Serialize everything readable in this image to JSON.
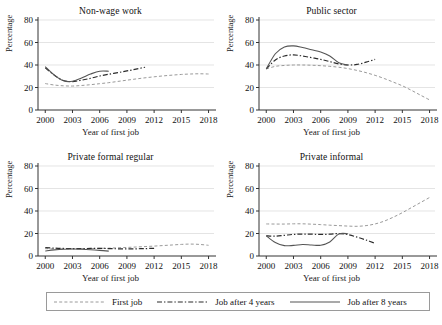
{
  "figure": {
    "panel_count": 4,
    "shared_xlabel": "Year of first job",
    "shared_ylabel": "Percentage"
  },
  "legend": {
    "items": [
      {
        "label": "First job",
        "style": "dotted-dash",
        "color": "#8c8c8c",
        "key": "first_job"
      },
      {
        "label": "Job after 4 years",
        "style": "dash-dot",
        "color": "#2b2b2b",
        "key": "after_4"
      },
      {
        "label": "Job after 8 years",
        "style": "solid",
        "color": "#4a4a4a",
        "key": "after_8"
      }
    ]
  },
  "panels": [
    {
      "title": "Non-wage work",
      "index": 0
    },
    {
      "title": "Public sector",
      "index": 1
    },
    {
      "title": "Private formal regular",
      "index": 2
    },
    {
      "title": "Private informal",
      "index": 3
    }
  ],
  "axes": {
    "xticks": [
      2000,
      2003,
      2006,
      2009,
      2012,
      2015,
      2018
    ],
    "yticks": [
      0,
      20,
      40,
      60,
      80
    ],
    "xlim": [
      1999.2,
      2018.6
    ],
    "ylim": [
      0,
      80
    ],
    "gridlines": [
      20,
      40,
      60,
      80
    ],
    "grid": true
  },
  "chart_data": {
    "type": "line",
    "title": "",
    "xlabel": "Year of first job",
    "ylabel": "Percentage",
    "xlim": [
      1999.2,
      2018.6
    ],
    "ylim": [
      0,
      80
    ],
    "grid": true,
    "legend_position": "bottom",
    "panel_layout": "2x2",
    "panels": [
      {
        "title": "Non-wage work",
        "series": [
          {
            "name": "First job",
            "style": "dotted-dash",
            "x": [
              2000,
              2001,
              2002,
              2003,
              2004,
              2005,
              2006,
              2007,
              2008,
              2009,
              2010,
              2011,
              2012,
              2013,
              2014,
              2015,
              2016,
              2017,
              2018
            ],
            "values": [
              23.5,
              22.2,
              21.5,
              21.3,
              21.8,
              22.5,
              23.4,
              24.3,
              25.4,
              26.5,
              27.6,
              28.6,
              29.5,
              30.3,
              31.0,
              31.6,
              32.0,
              32.2,
              32.0
            ]
          },
          {
            "name": "Job after 4 years",
            "style": "dash-dot",
            "x": [
              2000,
              2001,
              2002,
              2003,
              2004,
              2005,
              2006,
              2007,
              2008,
              2009,
              2010,
              2011
            ],
            "values": [
              37.5,
              31.0,
              26.2,
              25.3,
              26.5,
              28.2,
              30.2,
              31.8,
              33.2,
              34.7,
              36.3,
              38.0
            ]
          },
          {
            "name": "Job after 8 years",
            "style": "solid",
            "x": [
              2000,
              2001,
              2002,
              2003,
              2004,
              2005,
              2006,
              2007
            ],
            "values": [
              38.5,
              31.0,
              26.0,
              25.5,
              28.5,
              32.0,
              34.5,
              34.5
            ]
          }
        ]
      },
      {
        "title": "Public sector",
        "series": [
          {
            "name": "First job",
            "style": "dotted-dash",
            "x": [
              2000,
              2001,
              2002,
              2003,
              2004,
              2005,
              2006,
              2007,
              2008,
              2009,
              2010,
              2011,
              2012,
              2013,
              2014,
              2015,
              2016,
              2017,
              2018
            ],
            "values": [
              36.5,
              38.8,
              39.6,
              40.0,
              40.0,
              39.8,
              39.4,
              38.8,
              38.0,
              36.8,
              35.2,
              33.2,
              30.8,
              28.0,
              24.8,
              21.5,
              17.5,
              13.2,
              9.0
            ]
          },
          {
            "name": "Job after 4 years",
            "style": "dash-dot",
            "x": [
              2000,
              2001,
              2002,
              2003,
              2004,
              2005,
              2006,
              2007,
              2008,
              2009,
              2010,
              2011,
              2012
            ],
            "values": [
              36.5,
              44.5,
              48.0,
              49.0,
              48.0,
              46.5,
              45.0,
              43.0,
              41.0,
              40.0,
              40.5,
              42.5,
              45.0
            ]
          },
          {
            "name": "Job after 8 years",
            "style": "solid",
            "x": [
              2000,
              2001,
              2002,
              2003,
              2004,
              2005,
              2006,
              2007,
              2008,
              2009
            ],
            "values": [
              36.5,
              50.0,
              56.0,
              57.0,
              55.5,
              53.5,
              51.5,
              48.0,
              42.0,
              40.0
            ]
          }
        ]
      },
      {
        "title": "Private formal regular",
        "series": [
          {
            "name": "First job",
            "style": "dotted-dash",
            "x": [
              2000,
              2001,
              2002,
              2003,
              2004,
              2005,
              2006,
              2007,
              2008,
              2009,
              2010,
              2011,
              2012,
              2013,
              2014,
              2015,
              2016,
              2017,
              2018
            ],
            "values": [
              6.5,
              6.4,
              6.3,
              6.4,
              6.5,
              6.6,
              6.8,
              7.0,
              7.3,
              7.6,
              8.0,
              8.4,
              8.8,
              9.3,
              9.8,
              10.3,
              10.6,
              10.3,
              9.5
            ]
          },
          {
            "name": "Job after 4 years",
            "style": "dash-dot",
            "x": [
              2000,
              2001,
              2002,
              2003,
              2004,
              2005,
              2006,
              2007,
              2008,
              2009,
              2010,
              2011,
              2012
            ],
            "values": [
              7.5,
              7.0,
              6.7,
              6.6,
              6.6,
              6.7,
              6.8,
              6.6,
              6.4,
              6.3,
              6.4,
              6.6,
              6.8
            ]
          },
          {
            "name": "Job after 8 years",
            "style": "solid",
            "x": [
              2000,
              2001,
              2002,
              2003,
              2004,
              2005,
              2006,
              2007
            ],
            "values": [
              4.5,
              5.4,
              6.0,
              6.2,
              6.0,
              5.6,
              5.0,
              4.3
            ]
          }
        ]
      },
      {
        "title": "Private informal",
        "series": [
          {
            "name": "First job",
            "style": "dotted-dash",
            "x": [
              2000,
              2001,
              2002,
              2003,
              2004,
              2005,
              2006,
              2007,
              2008,
              2009,
              2010,
              2011,
              2012,
              2013,
              2014,
              2015,
              2016,
              2017,
              2018
            ],
            "values": [
              28.5,
              28.4,
              28.4,
              28.6,
              28.6,
              28.3,
              27.9,
              27.4,
              27.0,
              26.6,
              26.4,
              27.0,
              28.5,
              31.0,
              34.5,
              38.5,
              43.0,
              47.5,
              52.0
            ]
          },
          {
            "name": "Job after 4 years",
            "style": "dash-dot",
            "x": [
              2000,
              2001,
              2002,
              2003,
              2004,
              2005,
              2006,
              2007,
              2008,
              2009,
              2010,
              2011,
              2012
            ],
            "values": [
              18.0,
              17.6,
              18.4,
              19.2,
              19.5,
              19.4,
              19.2,
              19.4,
              20.0,
              19.0,
              16.8,
              14.2,
              11.2
            ]
          },
          {
            "name": "Job after 8 years",
            "style": "solid",
            "x": [
              2000,
              2001,
              2002,
              2003,
              2004,
              2005,
              2006,
              2007,
              2008,
              2009
            ],
            "values": [
              18.0,
              12.0,
              9.2,
              9.4,
              10.2,
              9.8,
              9.6,
              12.5,
              19.5,
              19.8
            ]
          }
        ]
      }
    ]
  }
}
